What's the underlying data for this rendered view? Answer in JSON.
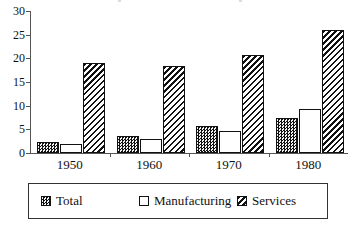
{
  "chart_data": {
    "type": "bar",
    "title": "",
    "subtitle": "",
    "xlabel": "",
    "ylabel": "",
    "categories": [
      "1950",
      "1960",
      "1970",
      "1980"
    ],
    "series": [
      {
        "name": "Total",
        "values": [
          2.4,
          3.6,
          5.7,
          7.4
        ],
        "pattern": "checker",
        "color": "#555555"
      },
      {
        "name": "Manufacturing",
        "values": [
          1.8,
          3.0,
          4.6,
          9.2
        ],
        "pattern": "solid",
        "color": "#ffffff"
      },
      {
        "name": "Services",
        "values": [
          19.0,
          18.3,
          20.6,
          26.0
        ],
        "pattern": "diagonal-hatch",
        "color": "#111111"
      }
    ],
    "ylim": [
      0,
      30
    ],
    "yticks": [
      0,
      5,
      10,
      15,
      20,
      25,
      30
    ],
    "ytick_labels": [
      "0",
      "5",
      "10",
      "15",
      "20",
      "25",
      "30"
    ],
    "grid": false,
    "legend_position": "bottom"
  },
  "legend": {
    "items": [
      {
        "label": "Total",
        "swatch": "checker-swatch"
      },
      {
        "label": "Manufacturing",
        "swatch": "empty-swatch"
      },
      {
        "label": "Services",
        "swatch": "hatch-swatch"
      }
    ]
  },
  "axes": {
    "y_axis_name": "value-axis",
    "x_axis_name": "year-axis"
  }
}
